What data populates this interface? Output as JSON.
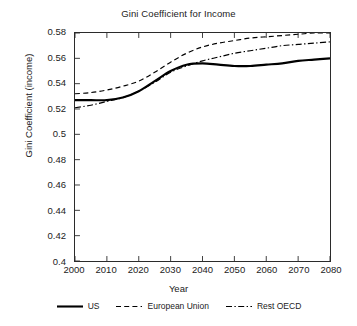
{
  "chart_data": {
    "type": "line",
    "title": "Gini Coefficient for Income",
    "xlabel": "Year",
    "ylabel": "Gini Coefficient (income)",
    "xlim": [
      2000,
      2080
    ],
    "ylim": [
      0.4,
      0.58
    ],
    "grid": false,
    "legend_position": "bottom",
    "xticks": [
      2000,
      2010,
      2020,
      2030,
      2040,
      2050,
      2060,
      2070,
      2080
    ],
    "xtick_labels": [
      "2000",
      "2010",
      "2020",
      "2030",
      "2040",
      "2050",
      "2060",
      "2070",
      "2080"
    ],
    "yticks": [
      0.4,
      0.42,
      0.44,
      0.46,
      0.48,
      0.5,
      0.52,
      0.54,
      0.56,
      0.58
    ],
    "ytick_labels": [
      "0.4",
      "0.42",
      "0.44",
      "0.46",
      "0.48",
      "0.5",
      "0.52",
      "0.54",
      "0.56",
      "0.58"
    ],
    "x": [
      2000,
      2005,
      2010,
      2015,
      2020,
      2025,
      2030,
      2035,
      2040,
      2045,
      2050,
      2055,
      2060,
      2065,
      2070,
      2075,
      2080
    ],
    "series": [
      {
        "name": "US",
        "style": "solid",
        "color": "#000000",
        "values": [
          0.527,
          0.527,
          0.527,
          0.529,
          0.534,
          0.542,
          0.55,
          0.555,
          0.556,
          0.555,
          0.554,
          0.554,
          0.555,
          0.556,
          0.558,
          0.559,
          0.56
        ]
      },
      {
        "name": "European Union",
        "style": "dashed",
        "color": "#000000",
        "values": [
          0.532,
          0.533,
          0.535,
          0.538,
          0.542,
          0.549,
          0.557,
          0.564,
          0.569,
          0.572,
          0.574,
          0.576,
          0.577,
          0.578,
          0.579,
          0.58,
          0.58
        ]
      },
      {
        "name": "Rest OECD",
        "style": "dashdot",
        "color": "#000000",
        "values": [
          0.521,
          0.523,
          0.526,
          0.529,
          0.534,
          0.541,
          0.549,
          0.554,
          0.558,
          0.561,
          0.564,
          0.566,
          0.568,
          0.57,
          0.571,
          0.572,
          0.573
        ]
      }
    ]
  },
  "legend": {
    "items": [
      {
        "label": "US",
        "style": "solid"
      },
      {
        "label": "European Union",
        "style": "dashed"
      },
      {
        "label": "Rest OECD",
        "style": "dashdot"
      }
    ]
  },
  "style": {
    "axis_color": "#2b2b2b",
    "line_color": "#000000",
    "background": "#ffffff"
  }
}
